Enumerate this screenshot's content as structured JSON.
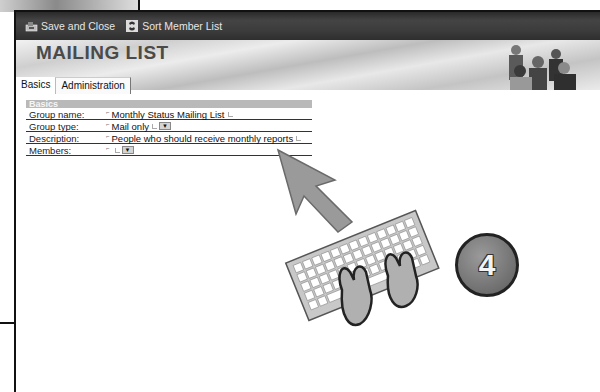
{
  "toolbar": {
    "save_close_label": "Save and Close",
    "sort_label": "Sort Member List"
  },
  "banner": {
    "title": "MAILING LIST"
  },
  "tabs": [
    {
      "label": "Basics",
      "active": true
    },
    {
      "label": "Administration",
      "active": false
    }
  ],
  "section": {
    "title": "Basics"
  },
  "fields": [
    {
      "label": "Group name:",
      "value": "Monthly Status Mailing List",
      "type": "text"
    },
    {
      "label": "Group type:",
      "value": "Mail only",
      "type": "dropdown"
    },
    {
      "label": "Description:",
      "value": "People who should receive monthly reports",
      "type": "text"
    },
    {
      "label": "Members:",
      "value": "",
      "type": "dropdown"
    }
  ],
  "step": {
    "number": "4"
  },
  "colors": {
    "toolbar_bg": "#3b3b3b",
    "section_header_bg": "#b9b9b9",
    "badge_bg": "#6f6f6f"
  }
}
